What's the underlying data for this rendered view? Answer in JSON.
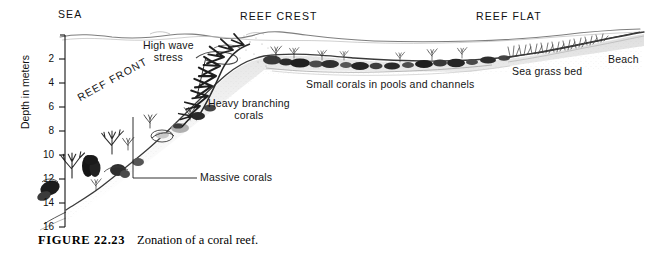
{
  "figure": {
    "caption_number": "FIGURE 22.23",
    "caption_text": "Zonation of a coral reef.",
    "background_color": "#ffffff",
    "ink_color": "#1a1a1a"
  },
  "axis": {
    "title": "Depth in meters",
    "unit": "meters",
    "min": 0,
    "max": 16,
    "tick_values": [
      2,
      4,
      6,
      8,
      10,
      12,
      14,
      16
    ],
    "tick_labels": [
      "2",
      "4",
      "6",
      "8",
      "10",
      "12",
      "14",
      "16"
    ]
  },
  "zones": [
    {
      "name": "sea",
      "label": "SEA"
    },
    {
      "name": "reef-front",
      "label": "REEF FRONT"
    },
    {
      "name": "reef-crest",
      "label": "REEF CREST"
    },
    {
      "name": "reef-flat",
      "label": "REEF FLAT"
    },
    {
      "name": "beach",
      "label": "Beach"
    }
  ],
  "annotations": [
    {
      "name": "high-wave-stress",
      "line1": "High wave",
      "line2": "stress"
    },
    {
      "name": "heavy-branching-corals",
      "line1": "Heavy branching",
      "line2": "corals"
    },
    {
      "name": "massive-corals",
      "line1": "Massive corals"
    },
    {
      "name": "small-corals",
      "line1": "Small corals in pools and channels"
    },
    {
      "name": "sea-grass-bed",
      "line1": "Sea grass bed"
    }
  ],
  "labels": {
    "sea": "SEA",
    "reef_front": "REEF FRONT",
    "reef_crest": "REEF CREST",
    "reef_flat": "REEF FLAT",
    "beach": "Beach",
    "high_wave_1": "High wave",
    "high_wave_2": "stress",
    "heavy_branching_1": "Heavy branching",
    "heavy_branching_2": "corals",
    "massive_corals": "Massive corals",
    "small_corals": "Small corals in pools and channels",
    "sea_grass_bed": "Sea grass bed",
    "depth_axis": "Depth in meters"
  }
}
